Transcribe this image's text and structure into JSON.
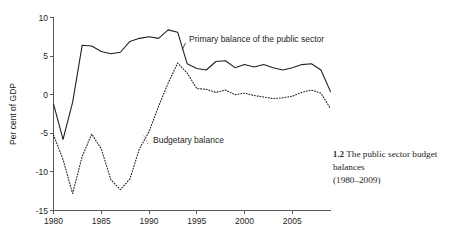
{
  "figure": {
    "caption_number": "1.2",
    "caption_title": "The public sector budget balances",
    "caption_years": "(1980–2009)"
  },
  "chart_data": {
    "type": "line",
    "title": "",
    "subtitle": "",
    "xlabel": "",
    "ylabel": "Per cent of GDP",
    "xlim": [
      1980,
      2009
    ],
    "ylim": [
      -15,
      10
    ],
    "xticks": [
      1980,
      1985,
      1990,
      1995,
      2000,
      2005
    ],
    "xtick_labels": [
      "1980",
      "1985",
      "1990",
      "1995",
      "2000",
      "2005"
    ],
    "yticks": [
      -15,
      -10,
      -5,
      0,
      5,
      10
    ],
    "ytick_labels": [
      "-15",
      "-10",
      "-5",
      "0",
      "5",
      "10"
    ],
    "grid": false,
    "legend_position": "inline-annotations",
    "x": [
      1980,
      1981,
      1982,
      1983,
      1984,
      1985,
      1986,
      1987,
      1988,
      1989,
      1990,
      1991,
      1992,
      1993,
      1994,
      1995,
      1996,
      1997,
      1998,
      1999,
      2000,
      2001,
      2002,
      2003,
      2004,
      2005,
      2006,
      2007,
      2008,
      2009
    ],
    "series": [
      {
        "name": "Primary balance of the public sector",
        "style": "solid",
        "values": [
          -1.2,
          -5.8,
          -1.0,
          6.4,
          6.3,
          5.6,
          5.3,
          5.5,
          6.9,
          7.3,
          7.5,
          7.3,
          8.4,
          8.1,
          4.0,
          3.4,
          3.2,
          4.3,
          4.4,
          3.5,
          3.9,
          3.6,
          3.9,
          3.5,
          3.2,
          3.5,
          3.9,
          4.0,
          3.2,
          0.4
        ]
      },
      {
        "name": "Budgetary balance",
        "style": "dotted",
        "values": [
          -5.2,
          -8.4,
          -12.8,
          -8.0,
          -5.1,
          -7.0,
          -11.0,
          -12.3,
          -10.9,
          -7.0,
          -4.8,
          -1.5,
          1.5,
          4.1,
          2.8,
          0.8,
          0.7,
          0.3,
          0.6,
          0.0,
          0.2,
          -0.1,
          -0.3,
          -0.5,
          -0.4,
          -0.2,
          0.3,
          0.6,
          0.2,
          -1.8
        ]
      }
    ],
    "annotations": [
      {
        "text": "Primary balance of the public sector",
        "series": "Primary balance of the public sector"
      },
      {
        "text": "Budgetary balance",
        "series": "Budgetary balance"
      }
    ]
  }
}
